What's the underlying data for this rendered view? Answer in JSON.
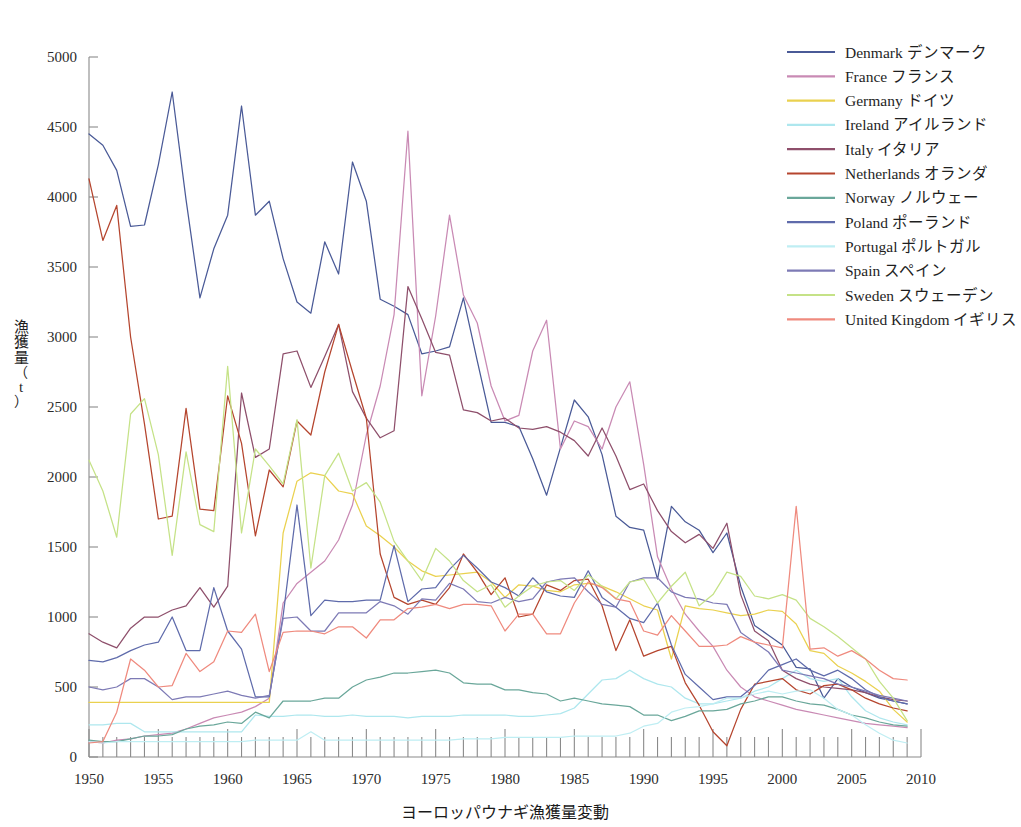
{
  "chart_data": {
    "type": "line",
    "title": "ヨーロッパウナギ漁獲量変動",
    "xlabel": "",
    "ylabel": "漁獲量（t）",
    "ylabel_chars": [
      "漁",
      "獲",
      "量",
      "（",
      "t",
      "）"
    ],
    "xlim": [
      1950,
      2010
    ],
    "ylim": [
      0,
      5000
    ],
    "grid": false,
    "legend_position": "top-right",
    "xticks": [
      1950,
      1955,
      1960,
      1965,
      1970,
      1975,
      1980,
      1985,
      1990,
      1995,
      2000,
      2005,
      2010
    ],
    "yticks": [
      0,
      500,
      1000,
      1500,
      2000,
      2500,
      3000,
      3500,
      4000,
      4500,
      5000
    ],
    "x": [
      1950,
      1951,
      1952,
      1953,
      1954,
      1955,
      1956,
      1957,
      1958,
      1959,
      1960,
      1961,
      1962,
      1963,
      1964,
      1965,
      1966,
      1967,
      1968,
      1969,
      1970,
      1971,
      1972,
      1973,
      1974,
      1975,
      1976,
      1977,
      1978,
      1979,
      1980,
      1981,
      1982,
      1983,
      1984,
      1985,
      1986,
      1987,
      1988,
      1989,
      1990,
      1991,
      1992,
      1993,
      1994,
      1995,
      1996,
      1997,
      1998,
      1999,
      2000,
      2001,
      2002,
      2003,
      2004,
      2005,
      2006,
      2007,
      2008,
      2009
    ],
    "series": [
      {
        "name": "Denmark",
        "name_ja": "デンマーク",
        "color": "#4a5a97",
        "values": [
          4450,
          4370,
          4190,
          3790,
          3800,
          4230,
          4750,
          3980,
          3280,
          3630,
          3870,
          4650,
          3870,
          3970,
          3560,
          3250,
          3170,
          3680,
          3450,
          4250,
          3970,
          3270,
          3220,
          3160,
          2880,
          2900,
          2930,
          3280,
          2830,
          2390,
          2390,
          2360,
          2130,
          1870,
          2210,
          2550,
          2430,
          2160,
          1720,
          1640,
          1620,
          1270,
          1790,
          1680,
          1620,
          1460,
          1600,
          1220,
          940,
          870,
          800,
          640,
          630,
          420,
          560,
          500,
          460,
          420,
          400,
          380
        ]
      },
      {
        "name": "France",
        "name_ja": "フランス",
        "color": "#c98ab4",
        "values": [
          110,
          100,
          120,
          130,
          150,
          160,
          170,
          200,
          240,
          280,
          300,
          320,
          360,
          420,
          1100,
          1240,
          1320,
          1400,
          1550,
          1800,
          2300,
          2650,
          3160,
          4470,
          2580,
          3150,
          3870,
          3300,
          3100,
          2650,
          2400,
          2440,
          2900,
          3120,
          2200,
          2400,
          2360,
          2200,
          2500,
          2680,
          2090,
          1430,
          1200,
          1020,
          900,
          790,
          620,
          500,
          430,
          400,
          370,
          340,
          320,
          300,
          280,
          260,
          240,
          230,
          220,
          210
        ]
      },
      {
        "name": "Germany",
        "name_ja": "ドイツ",
        "color": "#ead14f",
        "values": [
          390,
          390,
          390,
          390,
          390,
          390,
          390,
          390,
          390,
          390,
          390,
          390,
          390,
          390,
          1600,
          1970,
          2030,
          2010,
          1900,
          1880,
          1650,
          1580,
          1500,
          1400,
          1330,
          1290,
          1300,
          1310,
          1320,
          1250,
          1140,
          1230,
          1220,
          1190,
          1180,
          1230,
          1240,
          1220,
          1180,
          1130,
          1080,
          1050,
          700,
          1080,
          1060,
          1050,
          1030,
          1010,
          1020,
          1050,
          1040,
          950,
          760,
          740,
          650,
          600,
          540,
          470,
          340,
          250
        ]
      },
      {
        "name": "Ireland",
        "name_ja": "アイルランド",
        "color": "#aee7ee",
        "values": [
          230,
          230,
          240,
          240,
          180,
          180,
          180,
          180,
          180,
          180,
          180,
          180,
          300,
          290,
          290,
          300,
          300,
          290,
          290,
          300,
          290,
          290,
          290,
          280,
          290,
          290,
          290,
          300,
          300,
          300,
          300,
          290,
          290,
          300,
          310,
          350,
          450,
          550,
          560,
          620,
          560,
          520,
          500,
          420,
          380,
          380,
          400,
          420,
          470,
          500,
          560,
          620,
          560,
          540,
          560,
          430,
          330,
          280,
          250,
          230
        ]
      },
      {
        "name": "Italy",
        "name_ja": "イタリア",
        "color": "#8e4f6b",
        "values": [
          880,
          820,
          780,
          920,
          1000,
          1000,
          1050,
          1080,
          1210,
          1070,
          1220,
          2600,
          2140,
          2200,
          2880,
          2900,
          2640,
          2860,
          3090,
          2610,
          2420,
          2280,
          2330,
          3360,
          3130,
          2890,
          2870,
          2480,
          2460,
          2400,
          2420,
          2350,
          2340,
          2360,
          2320,
          2260,
          2150,
          2350,
          2150,
          1910,
          1950,
          1760,
          1610,
          1530,
          1590,
          1490,
          1670,
          1160,
          900,
          830,
          620,
          560,
          520,
          500,
          490,
          480,
          460,
          430,
          410,
          400
        ]
      },
      {
        "name": "Netherlands",
        "name_ja": "オランダ",
        "color": "#b5452e",
        "values": [
          4130,
          3690,
          3940,
          3000,
          2380,
          1700,
          1720,
          2490,
          1770,
          1760,
          2580,
          2240,
          1580,
          2050,
          1930,
          2400,
          2300,
          2750,
          3090,
          2750,
          2420,
          1450,
          1140,
          1090,
          1120,
          1090,
          1210,
          1450,
          1320,
          1160,
          1280,
          1000,
          1020,
          1230,
          1190,
          1260,
          1270,
          1080,
          760,
          980,
          720,
          760,
          790,
          530,
          370,
          180,
          80,
          340,
          520,
          540,
          560,
          480,
          450,
          510,
          520,
          480,
          420,
          380,
          350,
          330
        ]
      },
      {
        "name": "Norway",
        "name_ja": "ノルウェー",
        "color": "#6aa79a",
        "values": [
          120,
          110,
          110,
          130,
          150,
          150,
          160,
          200,
          220,
          230,
          250,
          240,
          320,
          280,
          400,
          400,
          400,
          420,
          420,
          500,
          550,
          570,
          600,
          600,
          610,
          620,
          600,
          530,
          520,
          520,
          480,
          480,
          460,
          450,
          400,
          420,
          400,
          380,
          370,
          360,
          300,
          300,
          260,
          290,
          330,
          330,
          340,
          380,
          400,
          430,
          430,
          400,
          380,
          370,
          340,
          300,
          280,
          250,
          230,
          220
        ]
      },
      {
        "name": "Poland",
        "name_ja": "ポーランド",
        "color": "#5f6bab",
        "values": [
          690,
          680,
          710,
          760,
          800,
          820,
          1000,
          760,
          760,
          1210,
          900,
          770,
          430,
          430,
          1010,
          1800,
          1010,
          1120,
          1110,
          1110,
          1120,
          1120,
          1510,
          1110,
          1200,
          1210,
          1340,
          1440,
          1350,
          1250,
          1210,
          1150,
          1280,
          1180,
          1150,
          1140,
          1330,
          1140,
          1070,
          990,
          960,
          1100,
          800,
          590,
          500,
          410,
          430,
          430,
          510,
          620,
          660,
          700,
          620,
          580,
          620,
          560,
          480,
          430,
          400,
          380
        ]
      },
      {
        "name": "Portugal",
        "name_ja": "ポルトガル",
        "color": "#bfeef3",
        "values": [
          110,
          100,
          110,
          110,
          110,
          110,
          110,
          110,
          110,
          110,
          110,
          110,
          120,
          120,
          120,
          120,
          180,
          120,
          120,
          120,
          120,
          120,
          120,
          120,
          120,
          120,
          120,
          130,
          130,
          130,
          140,
          140,
          140,
          140,
          140,
          150,
          150,
          150,
          150,
          170,
          220,
          240,
          320,
          350,
          360,
          380,
          420,
          420,
          450,
          470,
          450,
          470,
          480,
          420,
          340,
          300,
          230,
          170,
          120,
          100
        ]
      },
      {
        "name": "Spain",
        "name_ja": "スペイン",
        "color": "#7d7ab5",
        "values": [
          500,
          480,
          500,
          560,
          560,
          500,
          410,
          430,
          430,
          450,
          470,
          440,
          420,
          440,
          990,
          1000,
          900,
          900,
          1030,
          1030,
          1030,
          1110,
          1080,
          1020,
          1130,
          1120,
          1240,
          1200,
          1110,
          1100,
          1140,
          1110,
          1130,
          1250,
          1270,
          1280,
          1180,
          1090,
          1070,
          1250,
          1280,
          1280,
          1180,
          1140,
          1130,
          1100,
          1090,
          890,
          820,
          750,
          620,
          600,
          580,
          560,
          520,
          500,
          470,
          440,
          420,
          400
        ]
      },
      {
        "name": "Sweden",
        "name_ja": "スウェーデン",
        "color": "#c5e287",
        "values": [
          2120,
          1900,
          1570,
          2450,
          2560,
          2160,
          1440,
          2180,
          1660,
          1610,
          2790,
          1600,
          2200,
          2080,
          1950,
          2410,
          1350,
          2010,
          2170,
          1900,
          1960,
          1820,
          1540,
          1400,
          1260,
          1490,
          1400,
          1260,
          1180,
          1230,
          1070,
          1150,
          1220,
          1250,
          1260,
          1190,
          1300,
          1220,
          1130,
          1250,
          1270,
          1100,
          1220,
          1320,
          1080,
          1160,
          1320,
          1290,
          1150,
          1130,
          1160,
          1120,
          990,
          930,
          860,
          780,
          700,
          540,
          420,
          260
        ]
      },
      {
        "name": "United Kingdom",
        "name_ja": "イギリス",
        "color": "#ef8a7e",
        "values": [
          100,
          110,
          320,
          700,
          620,
          500,
          510,
          740,
          610,
          680,
          900,
          890,
          1020,
          610,
          890,
          900,
          900,
          880,
          930,
          930,
          850,
          980,
          980,
          1060,
          1070,
          1090,
          1060,
          1090,
          1090,
          1080,
          900,
          1020,
          1020,
          880,
          880,
          1100,
          1250,
          1210,
          1130,
          1110,
          900,
          870,
          1010,
          900,
          790,
          790,
          800,
          860,
          820,
          800,
          780,
          1790,
          770,
          780,
          720,
          760,
          700,
          620,
          560,
          550
        ]
      }
    ]
  },
  "legend": {
    "entries": [
      {
        "label": "Denmark  デンマーク"
      },
      {
        "label": "France  フランス"
      },
      {
        "label": "Germany  ドイツ"
      },
      {
        "label": "Ireland  アイルランド"
      },
      {
        "label": "Italy  イタリア"
      },
      {
        "label": "Netherlands  オランダ"
      },
      {
        "label": "Norway  ノルウェー"
      },
      {
        "label": "Poland  ポーランド"
      },
      {
        "label": "Portugal  ポルトガル"
      },
      {
        "label": "Spain  スペイン"
      },
      {
        "label": "Sweden  スウェーデン"
      },
      {
        "label": "United Kingdom  イギリス"
      }
    ]
  }
}
